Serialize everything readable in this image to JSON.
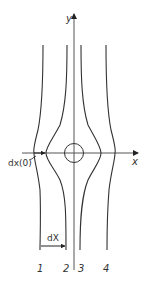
{
  "diagram": {
    "axes": {
      "x_label": "x",
      "y_label": "y"
    },
    "annotations": {
      "initial_offset": "dx(0)",
      "final_offset": "dX"
    },
    "trajectories": [
      {
        "label": "1"
      },
      {
        "label": "2"
      },
      {
        "label": "3"
      },
      {
        "label": "4"
      }
    ],
    "colors": {
      "line": "#333333",
      "axis": "#555555",
      "background": "#ffffff"
    }
  }
}
